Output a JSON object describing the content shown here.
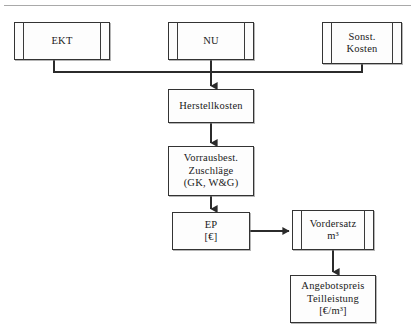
{
  "diagram": {
    "type": "flowchart",
    "background": "#ffffff",
    "line_color": "#333333",
    "box_fill": "#fdfdfd",
    "nodes": [
      {
        "id": "ekt",
        "label": "EKT",
        "shape": "predefined-process"
      },
      {
        "id": "nu",
        "label": "NU",
        "shape": "predefined-process"
      },
      {
        "id": "sonst",
        "label": "Sonst.\nKosten",
        "shape": "predefined-process"
      },
      {
        "id": "herst",
        "label": "Herstellkosten",
        "shape": "rectangle"
      },
      {
        "id": "zuschl",
        "label": "Vorrausbest.\nZuschläge\n(GK, W&G)",
        "shape": "rectangle"
      },
      {
        "id": "ep",
        "label": "EP\n[€]",
        "shape": "rectangle"
      },
      {
        "id": "vorder",
        "label": "Vordersatz\nm³",
        "shape": "predefined-process"
      },
      {
        "id": "angebot",
        "label": "Angebotspreis\nTeilleistung\n[€/m³]",
        "shape": "rectangle"
      }
    ],
    "edges": [
      {
        "from": "ekt",
        "to": "herst",
        "style": "elbow-down-merge"
      },
      {
        "from": "nu",
        "to": "herst",
        "style": "straight-down"
      },
      {
        "from": "sonst",
        "to": "herst",
        "style": "elbow-down-merge"
      },
      {
        "from": "herst",
        "to": "zuschl",
        "style": "straight-down"
      },
      {
        "from": "zuschl",
        "to": "ep",
        "style": "straight-down"
      },
      {
        "from": "ep",
        "to": "vorder",
        "style": "straight-right"
      },
      {
        "from": "vorder",
        "to": "angebot",
        "style": "straight-down"
      }
    ]
  }
}
